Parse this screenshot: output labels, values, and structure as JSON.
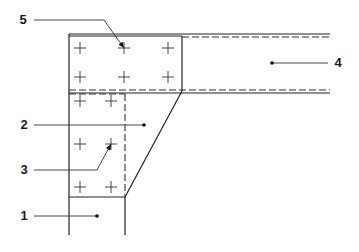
{
  "diagram": {
    "callouts": [
      {
        "id": "1",
        "label": "1",
        "text_x": 24,
        "text_y": 220,
        "line": [
          [
            34,
            216
          ],
          [
            97,
            216
          ]
        ],
        "end": "dot",
        "end_xy": [
          97,
          216
        ]
      },
      {
        "id": "2",
        "label": "2",
        "text_x": 24,
        "text_y": 129,
        "line": [
          [
            34,
            125
          ],
          [
            144,
            125
          ]
        ],
        "end": "dot",
        "end_xy": [
          144,
          125
        ]
      },
      {
        "id": "3",
        "label": "3",
        "text_x": 24,
        "text_y": 174,
        "line": [
          [
            34,
            170
          ],
          [
            97,
            170
          ],
          [
            111,
            144
          ]
        ],
        "end": "arrow",
        "end_xy": [
          111,
          144
        ]
      },
      {
        "id": "4",
        "label": "4",
        "text_x": 338,
        "text_y": 67,
        "line": [
          [
            328,
            63
          ],
          [
            272,
            63
          ]
        ],
        "end": "dot",
        "end_xy": [
          272,
          63
        ]
      },
      {
        "id": "5",
        "label": "5",
        "text_x": 23,
        "text_y": 24,
        "line": [
          [
            34,
            20
          ],
          [
            104,
            20
          ],
          [
            124,
            48
          ]
        ],
        "end": "arrow",
        "end_xy": [
          124,
          48
        ]
      }
    ],
    "components": [
      {
        "id": "1",
        "name": "column"
      },
      {
        "id": "2",
        "name": "gusset-plate"
      },
      {
        "id": "3",
        "name": "bolt"
      },
      {
        "id": "4",
        "name": "beam"
      },
      {
        "id": "5",
        "name": "bolt"
      }
    ],
    "bolts": [
      [
        80,
        48
      ],
      [
        124,
        48
      ],
      [
        168,
        48
      ],
      [
        80,
        77
      ],
      [
        124,
        77
      ],
      [
        168,
        77
      ],
      [
        80,
        101
      ],
      [
        111,
        101
      ],
      [
        80,
        144
      ],
      [
        111,
        144
      ],
      [
        80,
        187
      ],
      [
        111,
        187
      ]
    ],
    "colors": {
      "line": "#222222",
      "background": "#ffffff"
    }
  }
}
